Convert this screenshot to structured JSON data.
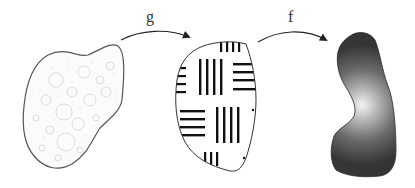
{
  "diagram": {
    "labels": {
      "g": "g",
      "f": "f"
    },
    "regions": [
      {
        "id": "domain",
        "style": "textured-bubbles",
        "outline": "#555555"
      },
      {
        "id": "intermediate",
        "style": "bar-pattern",
        "outline": "#333333"
      },
      {
        "id": "target",
        "style": "radial-gradient",
        "fill_dark": "#3a3a3a",
        "fill_light": "#f2f2f2"
      }
    ],
    "arrows": [
      {
        "from": "domain",
        "to": "intermediate",
        "label": "g"
      },
      {
        "from": "intermediate",
        "to": "target",
        "label": "f"
      }
    ]
  }
}
